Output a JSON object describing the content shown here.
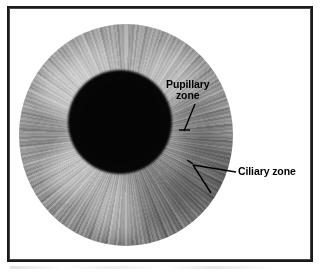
{
  "figure": {
    "background_color": "#ffffff",
    "frame_color": "#1a1a1a"
  },
  "eye": {
    "iris": {
      "name": "iris",
      "center": [
        126,
        135
      ],
      "radius": 107,
      "color_light": "#b9b9b9",
      "color_mid": "#8b8b8b",
      "color_rim": "#272727"
    },
    "pupil": {
      "name": "pupil",
      "center": [
        117,
        122
      ],
      "radius": 52,
      "color": "#050505"
    }
  },
  "annotations": [
    {
      "id": "pupillary-zone",
      "line1": "Pupillary",
      "line2": "zone",
      "text_color": "#000000",
      "leader": "diagonal line from text down-left to a horizontal tick at the pupil margin"
    },
    {
      "id": "ciliary-zone",
      "text": "Ciliary zone",
      "text_color": "#000000",
      "leader": "forked two-pronged line reaching the outer iris band"
    }
  ]
}
